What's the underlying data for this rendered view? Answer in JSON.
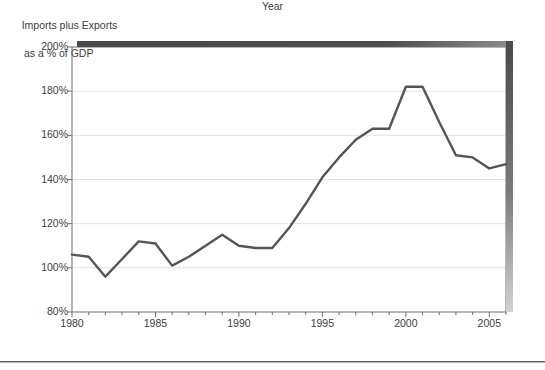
{
  "chart_data": {
    "type": "line",
    "title": "Imports plus Exports\nas a % of GDP",
    "title_line1": "Imports plus Exports",
    "title_line2": "as a % of GDP",
    "xlabel": "Year",
    "ylabel": "",
    "xlim": [
      1980,
      2006
    ],
    "ylim": [
      80,
      200
    ],
    "ytick_values": [
      80,
      100,
      120,
      140,
      160,
      180,
      200
    ],
    "ytick_labels": [
      "80%",
      "100%",
      "120%",
      "140%",
      "160%",
      "180%",
      "200%"
    ],
    "xtick_values": [
      1980,
      1985,
      1990,
      1995,
      2000,
      2005
    ],
    "xtick_labels": [
      "1980",
      "1985",
      "1990",
      "1995",
      "2000",
      "2005"
    ],
    "grid": "horizontal",
    "legend": "none",
    "series": [
      {
        "name": "Imports plus Exports as a % of GDP",
        "color": "#555555",
        "x": [
          1980,
          1981,
          1982,
          1983,
          1984,
          1985,
          1986,
          1987,
          1988,
          1989,
          1990,
          1991,
          1992,
          1993,
          1994,
          1995,
          1996,
          1997,
          1998,
          1999,
          2000,
          2001,
          2002,
          2003,
          2004,
          2005,
          2006
        ],
        "values": [
          106,
          105,
          96,
          104,
          112,
          111,
          101,
          105,
          110,
          115,
          110,
          109,
          109,
          118,
          129,
          141,
          150,
          158,
          163,
          163,
          182,
          182,
          166,
          151,
          150,
          145,
          147
        ]
      }
    ],
    "colors": {
      "line": "#555555",
      "gridline": "#e2e2e2",
      "axis": "#6e6e6e",
      "text": "#3d3d3d",
      "shadow": "#4a4a4a"
    }
  }
}
